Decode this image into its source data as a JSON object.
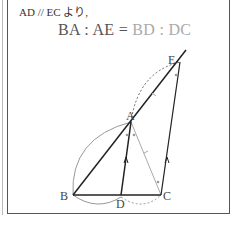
{
  "caption": "AD // EC より,",
  "equation": {
    "left": "BA : AE",
    "equals": " = ",
    "right": "BD : DC"
  },
  "points": {
    "A": {
      "label": "A",
      "x": 131,
      "y": 122
    },
    "B": {
      "label": "B",
      "x": 73,
      "y": 195
    },
    "C": {
      "label": "C",
      "x": 161,
      "y": 195
    },
    "D": {
      "label": "D",
      "x": 121,
      "y": 195
    },
    "E": {
      "label": "E",
      "x": 180,
      "y": 62
    }
  },
  "colors": {
    "line": "#333333",
    "aux": "#999999",
    "frame": "#555555"
  }
}
